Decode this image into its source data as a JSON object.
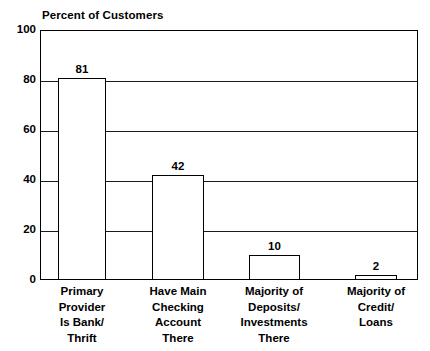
{
  "chart_data": {
    "type": "bar",
    "title": "Percent of Customers",
    "xlabel": "",
    "ylabel": "Percent of Customers",
    "ylim": [
      0,
      100
    ],
    "yticks": [
      0,
      20,
      40,
      60,
      80,
      100
    ],
    "grid": true,
    "legend": "none",
    "categories": [
      "Primary Provider Is Bank/ Thrift",
      "Have Main Checking Account There",
      "Majority of Deposits/ Investments There",
      "Majority of Credit/ Loans"
    ],
    "category_lines": [
      [
        "Primary",
        "Provider",
        "Is Bank/",
        "Thrift"
      ],
      [
        "Have Main",
        "Checking",
        "Account",
        "There"
      ],
      [
        "Majority of",
        "Deposits/",
        "Investments",
        "There"
      ],
      [
        "Majority of",
        "Credit/",
        "Loans"
      ]
    ],
    "values": [
      81,
      42,
      10,
      2
    ],
    "value_labels": [
      "81",
      "42",
      "10",
      "2"
    ],
    "colors": {
      "bar_fill": "#ffffff",
      "bar_stroke": "#000000",
      "gridline": "#1a1a1a",
      "axis": "#000000",
      "text": "#000000",
      "background": "#ffffff"
    }
  },
  "axis": {
    "y_tick_labels": [
      "100",
      "80",
      "60",
      "40",
      "20",
      "0"
    ]
  }
}
